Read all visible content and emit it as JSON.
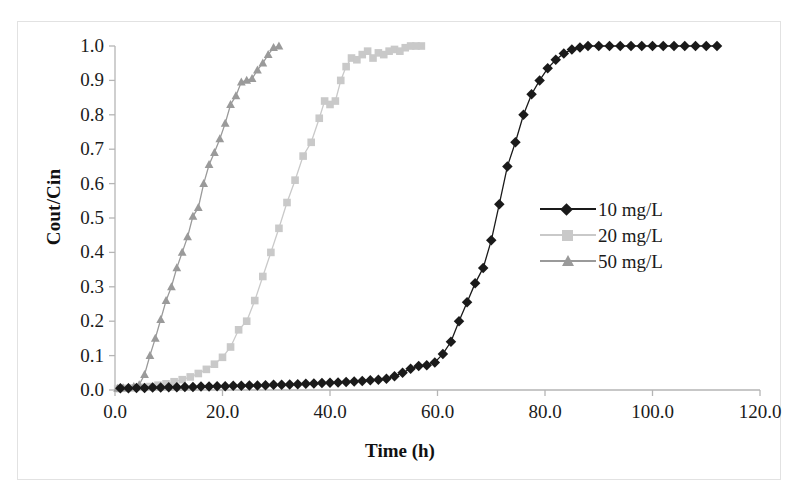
{
  "chart_data": {
    "type": "line",
    "title": "",
    "xlabel": "Time (h)",
    "ylabel": "Cout/Cin",
    "xlim": [
      0,
      120
    ],
    "ylim": [
      0,
      1.0
    ],
    "xticks": [
      "0.0",
      "20.0",
      "40.0",
      "60.0",
      "80.0",
      "100.0",
      "120.0"
    ],
    "yticks": [
      "0.0",
      "0.1",
      "0.2",
      "0.3",
      "0.4",
      "0.5",
      "0.6",
      "0.7",
      "0.8",
      "0.9",
      "1.0"
    ],
    "grid": false,
    "legend_position": "right-center",
    "series": [
      {
        "name": "10 mg/L",
        "color": "#1a1a1a",
        "marker": "diamond",
        "x": [
          1,
          2.5,
          4,
          5.5,
          7,
          8.5,
          10,
          11.5,
          13,
          14.5,
          16,
          17.5,
          19,
          20.5,
          22,
          23.5,
          25,
          26.5,
          28,
          29.5,
          31,
          32.5,
          34,
          35.5,
          37,
          38.5,
          40,
          41.5,
          43,
          44.5,
          46,
          47.5,
          49,
          50.5,
          52,
          53.5,
          55,
          56.5,
          58,
          59.5,
          61,
          62.5,
          64,
          65.5,
          67,
          68.5,
          70,
          71.5,
          73,
          74.5,
          76,
          77.5,
          79,
          80.5,
          82,
          83.5,
          85,
          86.5,
          88,
          90,
          92,
          94,
          96,
          98,
          100,
          102,
          104,
          106,
          108,
          110,
          112
        ],
        "y": [
          0.005,
          0.005,
          0.006,
          0.006,
          0.007,
          0.007,
          0.008,
          0.008,
          0.009,
          0.009,
          0.01,
          0.01,
          0.011,
          0.011,
          0.012,
          0.012,
          0.013,
          0.013,
          0.014,
          0.015,
          0.015,
          0.016,
          0.017,
          0.018,
          0.019,
          0.02,
          0.021,
          0.022,
          0.023,
          0.025,
          0.026,
          0.028,
          0.03,
          0.033,
          0.04,
          0.05,
          0.062,
          0.07,
          0.072,
          0.08,
          0.105,
          0.14,
          0.2,
          0.255,
          0.31,
          0.355,
          0.435,
          0.54,
          0.65,
          0.72,
          0.8,
          0.86,
          0.9,
          0.935,
          0.96,
          0.978,
          0.99,
          0.996,
          1.0,
          1.0,
          1.0,
          1.0,
          1.0,
          1.0,
          1.0,
          1.0,
          1.0,
          1.0,
          1.0,
          1.0,
          1.0
        ]
      },
      {
        "name": "20 mg/L",
        "color": "#c9c9c9",
        "marker": "square",
        "x": [
          0.5,
          2,
          3.5,
          5,
          6.5,
          8,
          9.5,
          11,
          12.5,
          14,
          15.5,
          17,
          18.5,
          20,
          21.5,
          23,
          24.5,
          26,
          27.5,
          29,
          30.5,
          32,
          33.5,
          35,
          36.5,
          38,
          39,
          40,
          41,
          42,
          43,
          44,
          45,
          46,
          47,
          48,
          49,
          50,
          51,
          52,
          53,
          54,
          55,
          56,
          57
        ],
        "y": [
          0.004,
          0.005,
          0.006,
          0.008,
          0.01,
          0.014,
          0.018,
          0.024,
          0.03,
          0.038,
          0.048,
          0.06,
          0.075,
          0.095,
          0.125,
          0.175,
          0.2,
          0.26,
          0.33,
          0.4,
          0.47,
          0.545,
          0.61,
          0.68,
          0.72,
          0.79,
          0.84,
          0.83,
          0.84,
          0.9,
          0.94,
          0.965,
          0.96,
          0.975,
          0.985,
          0.965,
          0.98,
          0.975,
          0.985,
          0.99,
          0.985,
          0.995,
          1.0,
          1.0,
          1.0
        ]
      },
      {
        "name": "50 mg/L",
        "color": "#9a9a9a",
        "marker": "triangle",
        "x": [
          0.5,
          1.5,
          2.5,
          3.5,
          4.5,
          5.5,
          6.5,
          7.5,
          8.5,
          9.5,
          10.5,
          11.5,
          12.5,
          13.5,
          14.5,
          15.5,
          16.5,
          17.5,
          18.5,
          19.5,
          20.5,
          21.5,
          22.5,
          23.5,
          24.5,
          25.5,
          26.5,
          27.5,
          28.5,
          29.5,
          30.5
        ],
        "y": [
          0.005,
          0.006,
          0.008,
          0.01,
          0.015,
          0.045,
          0.1,
          0.15,
          0.205,
          0.26,
          0.3,
          0.355,
          0.4,
          0.445,
          0.505,
          0.53,
          0.6,
          0.655,
          0.69,
          0.73,
          0.775,
          0.83,
          0.855,
          0.895,
          0.9,
          0.905,
          0.93,
          0.95,
          0.975,
          0.995,
          1.0
        ]
      }
    ]
  },
  "legend": {
    "items": [
      {
        "label": "10 mg/L"
      },
      {
        "label": "20 mg/L"
      },
      {
        "label": "50 mg/L"
      }
    ]
  }
}
